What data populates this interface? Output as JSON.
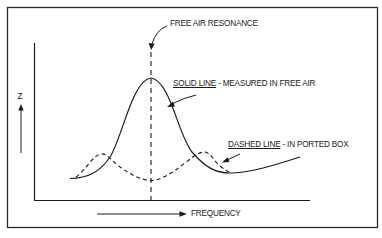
{
  "diagram": {
    "labels": {
      "resonance": "FREE AIR RESONANCE",
      "solid_line_key": "SOLID LINE",
      "solid_line_desc": " - MEASURED IN FREE AIR",
      "dashed_line_key": "DASHED LINE",
      "dashed_line_desc": " - IN PORTED BOX",
      "y_axis": "Z",
      "x_axis": "FREQUENCY"
    },
    "colors": {
      "ink": "#1c1c1c",
      "frame": "#2a2a2a",
      "background": "#ffffff"
    },
    "curves": [
      {
        "name": "solid-line",
        "style": "solid",
        "meaning": "Measured in free air",
        "shape": "single impedance peak at free air resonance"
      },
      {
        "name": "dashed-line",
        "style": "dashed",
        "meaning": "In ported box",
        "shape": "two smaller peaks on either side of resonance with a dip at resonance"
      }
    ]
  }
}
